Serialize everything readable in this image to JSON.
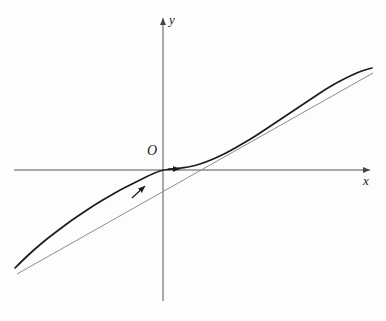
{
  "figure": {
    "background_color": "#fdfdfd"
  },
  "labels": {
    "y_axis": "y",
    "x_axis": "x",
    "origin": "O"
  },
  "colors": {
    "curve": "#1c1c1c",
    "asymptote": "#8d8d8d",
    "axis": "#555555",
    "text": "#1a1a1a"
  },
  "chart_data": {
    "type": "line",
    "title": "",
    "xlabel": "x",
    "ylabel": "y",
    "grid": false,
    "legend": "none",
    "axes": {
      "origin_px": [
        163,
        170
      ],
      "x_axis_px": {
        "x_start": 14,
        "x_end": 372,
        "y": 170,
        "arrow_at": [
          372,
          170
        ]
      },
      "y_axis_px": {
        "y_start": 16,
        "y_end": 301,
        "x": 163,
        "arrow_at": [
          163,
          16
        ]
      }
    },
    "series": [
      {
        "name": "curve",
        "style": "solid-thick",
        "color": "#1c1c1c",
        "description": "Curve tangent to the x-axis at the origin, approaching the oblique asymptote from above on both sides",
        "points_px": [
          [
            15,
            268
          ],
          [
            24,
            259
          ],
          [
            36,
            248
          ],
          [
            48,
            238
          ],
          [
            60,
            229
          ],
          [
            72,
            220
          ],
          [
            84,
            212
          ],
          [
            96,
            204
          ],
          [
            108,
            197
          ],
          [
            120,
            190
          ],
          [
            132,
            184
          ],
          [
            142,
            179
          ],
          [
            150,
            175
          ],
          [
            157,
            172
          ],
          [
            163,
            170
          ],
          [
            172,
            169
          ],
          [
            182,
            168
          ],
          [
            194,
            166
          ],
          [
            206,
            162
          ],
          [
            218,
            157
          ],
          [
            230,
            151
          ],
          [
            242,
            144
          ],
          [
            254,
            137
          ],
          [
            266,
            129
          ],
          [
            278,
            121
          ],
          [
            290,
            113
          ],
          [
            302,
            105
          ],
          [
            314,
            97
          ],
          [
            326,
            89
          ],
          [
            338,
            82
          ],
          [
            350,
            76
          ],
          [
            361,
            71
          ],
          [
            372,
            68
          ]
        ]
      },
      {
        "name": "asymptote",
        "style": "solid-thin",
        "color": "#8d8d8d",
        "description": "Straight oblique asymptote crossing the x-axis near x = 222 px",
        "points_px": [
          [
            17,
            274
          ],
          [
            222,
            170
          ],
          [
            373,
            73
          ]
        ]
      }
    ],
    "annotations": [
      {
        "name": "direction-arrow-on-axis",
        "type": "arrowhead",
        "position_px": [
          184,
          168
        ],
        "direction": "right",
        "description": "Small arrowhead along the curve just right of the origin"
      },
      {
        "name": "direction-arrow-on-curve",
        "type": "arrowhead",
        "position_px": [
          146,
          185
        ],
        "direction": "up-right",
        "description": "Small arrowhead on the curve below-left of the origin"
      }
    ]
  }
}
